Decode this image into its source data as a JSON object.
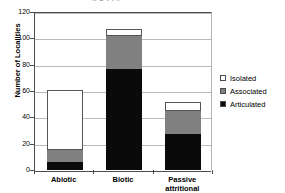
{
  "chart_data": {
    "type": "bar",
    "subtype": "stacked",
    "title": "n = 213",
    "title_clipped": true,
    "xlabel": "",
    "ylabel": "Number of Localities",
    "ylim": [
      0,
      120
    ],
    "yticks": [
      0,
      20,
      40,
      60,
      80,
      100,
      120
    ],
    "grid": true,
    "legend_position": "right",
    "categories": [
      "Abiotic",
      "Biotic",
      "Passive attritional"
    ],
    "series": [
      {
        "name": "Articulated",
        "color": "#0a0a0a",
        "values": [
          6,
          77,
          27
        ]
      },
      {
        "name": "Associated",
        "color": "#808080",
        "values": [
          9,
          25,
          18
        ]
      },
      {
        "name": "Isolated",
        "color": "#ffffff",
        "values": [
          46,
          5,
          7
        ]
      }
    ],
    "totals": [
      61,
      107,
      52
    ]
  },
  "axis": {
    "y_title": "Number of Localities",
    "y_tick_labels": [
      "0",
      "20",
      "40",
      "60",
      "80",
      "100",
      "120"
    ],
    "x_tick_labels": [
      {
        "line1": "Abiotic",
        "line2": ""
      },
      {
        "line1": "Biotic",
        "line2": ""
      },
      {
        "line1": "Passive",
        "line2": "attritional"
      }
    ]
  },
  "legend": {
    "entries": [
      {
        "label": "Isolated",
        "color": "#ffffff"
      },
      {
        "label": "Associated",
        "color": "#808080"
      },
      {
        "label": "Articulated",
        "color": "#0a0a0a"
      }
    ]
  }
}
